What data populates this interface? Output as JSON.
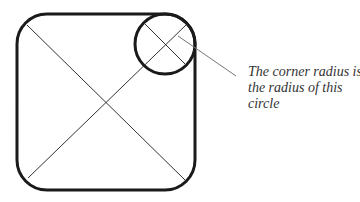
{
  "diagram": {
    "caption_lines": [
      "The corner radius is",
      "the radius of this",
      "circle"
    ],
    "colors": {
      "stroke": "#1a1a1a",
      "thin_line": "#333333",
      "leader": "#777777",
      "text": "#333333"
    },
    "shapes": {
      "rounded_rect": {
        "x": 17,
        "y": 14,
        "width": 178,
        "height": 176,
        "radius": 30
      },
      "corner_circle": {
        "cx": 165,
        "cy": 44,
        "r": 30
      },
      "leader_line": {
        "x1": 178,
        "y1": 36,
        "x2": 236,
        "y2": 76
      }
    }
  }
}
